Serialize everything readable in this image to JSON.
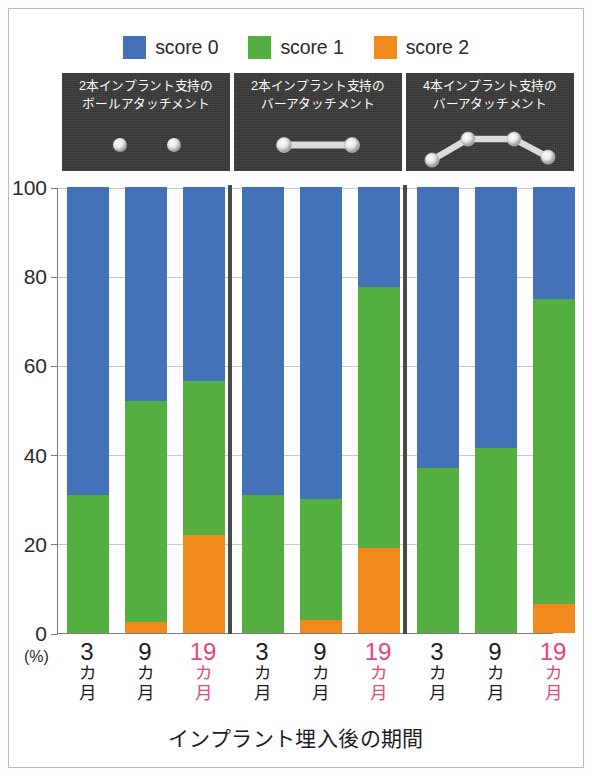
{
  "figure": {
    "background_color": "#ffffff",
    "border_color": "#b9b9b9"
  },
  "legend": {
    "position": "top-center",
    "items": [
      {
        "label": "score 0",
        "color": "#4372b8",
        "icon": "legend-swatch-blue"
      },
      {
        "label": "score 1",
        "color": "#54af41",
        "icon": "legend-swatch-green"
      },
      {
        "label": "score 2",
        "color": "#f18a1c",
        "icon": "legend-swatch-orange"
      }
    ]
  },
  "panels": [
    {
      "caption": "2本インプラント支持の\nボールアタッチメント",
      "diagram": "two-ball-attachments",
      "implants": 2
    },
    {
      "caption": "2本インプラント支持の\nバーアタッチメント",
      "diagram": "two-implant-bar",
      "implants": 2
    },
    {
      "caption": "4本インプラント支持の\nバーアタッチメント",
      "diagram": "four-implant-bar",
      "implants": 4
    }
  ],
  "axis": {
    "y_unit": "(%)",
    "y_ticks": [
      "0",
      "20",
      "40",
      "60",
      "80",
      "100"
    ],
    "x_title": "インプラント埋入後の期間",
    "highlight_color": "#e8447e"
  },
  "x_labels": [
    {
      "value": "3",
      "unit": "カ\n月",
      "highlight": false
    },
    {
      "value": "9",
      "unit": "カ\n月",
      "highlight": false
    },
    {
      "value": "19",
      "unit": "カ\n月",
      "highlight": true
    },
    {
      "value": "3",
      "unit": "カ\n月",
      "highlight": false
    },
    {
      "value": "9",
      "unit": "カ\n月",
      "highlight": false
    },
    {
      "value": "19",
      "unit": "カ\n月",
      "highlight": true
    },
    {
      "value": "3",
      "unit": "カ\n月",
      "highlight": false
    },
    {
      "value": "9",
      "unit": "カ\n月",
      "highlight": false
    },
    {
      "value": "19",
      "unit": "カ\n月",
      "highlight": true
    }
  ],
  "chart_data": {
    "type": "bar",
    "subtype": "stacked-percentage",
    "title": "",
    "xlabel": "インプラント埋入後の期間",
    "ylabel": "(%)",
    "ylim": [
      0,
      100
    ],
    "yticks": [
      0,
      20,
      40,
      60,
      80,
      100
    ],
    "grid": true,
    "legend_position": "top-center",
    "categories": [
      "3カ月",
      "9カ月",
      "19カ月",
      "3カ月",
      "9カ月",
      "19カ月",
      "3カ月",
      "9カ月",
      "19カ月"
    ],
    "groups": [
      {
        "name": "2本インプラント支持のボールアタッチメント",
        "categories": [
          "3カ月",
          "9カ月",
          "19カ月"
        ]
      },
      {
        "name": "2本インプラント支持のバーアタッチメント",
        "categories": [
          "3カ月",
          "9カ月",
          "19カ月"
        ]
      },
      {
        "name": "4本インプラント支持のバーアタッチメント",
        "categories": [
          "3カ月",
          "9カ月",
          "19カ月"
        ]
      }
    ],
    "series": [
      {
        "name": "score 0",
        "color": "#4372b8",
        "values": [
          69,
          48,
          43.5,
          69,
          70,
          22.5,
          63,
          58.5,
          25
        ]
      },
      {
        "name": "score 1",
        "color": "#54af41",
        "values": [
          31,
          49.5,
          34.5,
          31,
          27,
          58.5,
          37,
          41.5,
          68.5
        ]
      },
      {
        "name": "score 2",
        "color": "#f18a1c",
        "values": [
          0,
          2.5,
          22,
          0,
          3,
          19,
          0,
          0,
          6.5
        ]
      }
    ],
    "cumulative_tops": {
      "score_2": [
        0,
        2.5,
        22,
        0,
        3,
        19,
        0,
        0,
        6.5
      ],
      "score_1": [
        31,
        52,
        56.5,
        31,
        30,
        77.5,
        37,
        41.5,
        75
      ],
      "score_0": [
        100,
        100,
        100,
        100,
        100,
        100,
        100,
        100,
        100
      ]
    }
  }
}
